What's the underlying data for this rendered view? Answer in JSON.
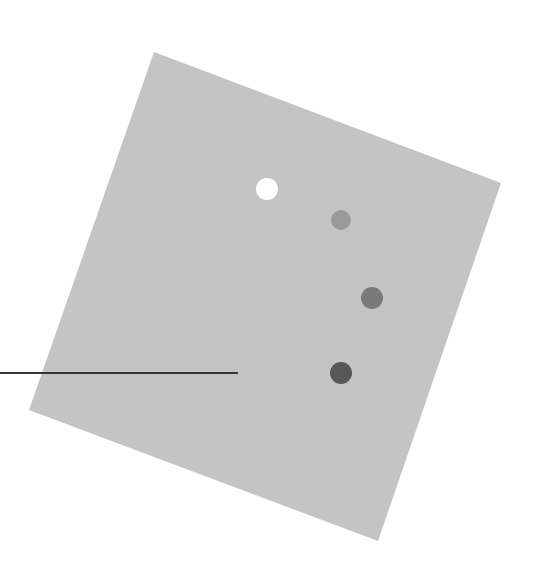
{
  "canvas": {
    "width": 545,
    "height": 567,
    "background": "#ffffff"
  },
  "diagram": {
    "panel": {
      "shape": "rotated-square",
      "fill": "#c4c4c4",
      "points": [
        [
          154,
          52
        ],
        [
          501,
          183
        ],
        [
          378,
          541
        ],
        [
          29,
          410
        ]
      ]
    },
    "dots": [
      {
        "id": "dot-1",
        "cx": 267,
        "cy": 189,
        "r": 11,
        "fill": "#ffffff"
      },
      {
        "id": "dot-2",
        "cx": 341,
        "cy": 220,
        "r": 10,
        "fill": "#9a9a9a"
      },
      {
        "id": "dot-3",
        "cx": 372,
        "cy": 298,
        "r": 11,
        "fill": "#7a7a7a"
      },
      {
        "id": "dot-4",
        "cx": 341,
        "cy": 373,
        "r": 11,
        "fill": "#575757"
      }
    ],
    "pointer_line": {
      "x1": 0,
      "y1": 373,
      "x2": 238,
      "y2": 373,
      "stroke": "#333333",
      "stroke_width": 2
    }
  }
}
